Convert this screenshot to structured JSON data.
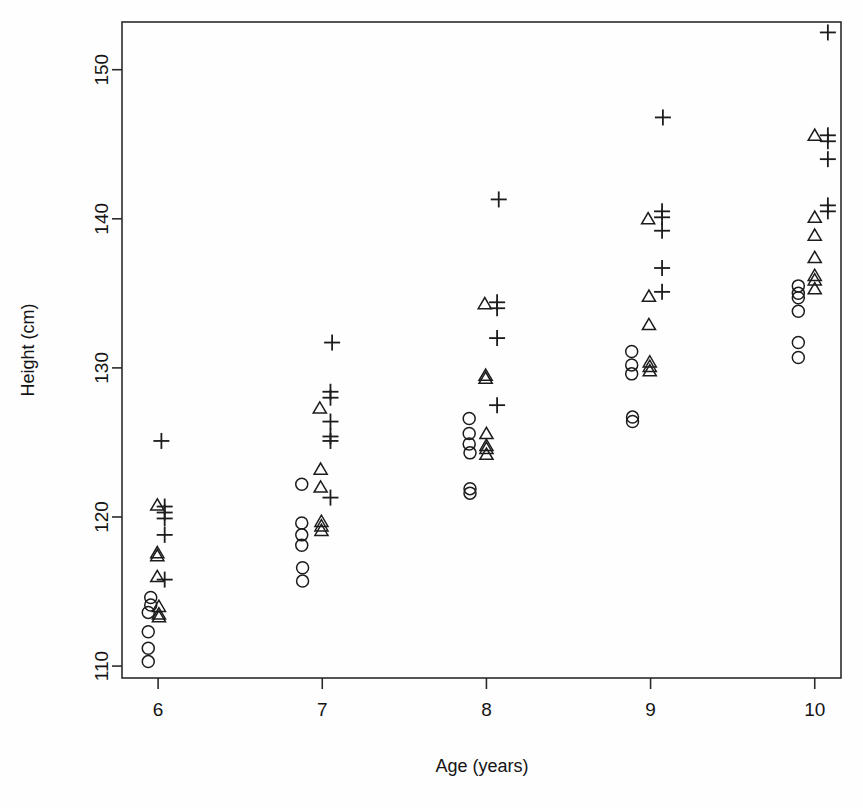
{
  "chart_data": {
    "type": "scatter",
    "title": "",
    "xlabel": "Age (years)",
    "ylabel": "Height (cm)",
    "xlim": [
      5.78,
      10.16
    ],
    "ylim": [
      109.2,
      153.2
    ],
    "xticks": [
      6,
      7,
      8,
      9,
      10
    ],
    "yticks": [
      110,
      120,
      130,
      140,
      150
    ],
    "xtick_labels": [
      "6",
      "7",
      "8",
      "9",
      "10"
    ],
    "ytick_labels": [
      "110",
      "120",
      "130",
      "140",
      "150"
    ],
    "grid": false,
    "legend": "none",
    "marker_color": "#1c1c1c",
    "background": "#ffffff",
    "series": [
      {
        "name": "circle",
        "marker": "open-circle",
        "points": [
          [
            5.955,
            114.6
          ],
          [
            5.955,
            114.1
          ],
          [
            5.94,
            113.6
          ],
          [
            5.94,
            112.3
          ],
          [
            5.94,
            111.2
          ],
          [
            5.94,
            110.3
          ],
          [
            6.875,
            122.2
          ],
          [
            6.875,
            119.6
          ],
          [
            6.875,
            118.8
          ],
          [
            6.875,
            118.1
          ],
          [
            6.88,
            116.6
          ],
          [
            6.88,
            115.7
          ],
          [
            7.895,
            126.6
          ],
          [
            7.895,
            125.6
          ],
          [
            7.895,
            124.9
          ],
          [
            7.9,
            124.3
          ],
          [
            7.9,
            121.9
          ],
          [
            7.9,
            121.6
          ],
          [
            8.885,
            131.1
          ],
          [
            8.885,
            130.2
          ],
          [
            8.885,
            129.6
          ],
          [
            8.89,
            126.7
          ],
          [
            8.89,
            126.4
          ],
          [
            9.9,
            135.5
          ],
          [
            9.9,
            135.0
          ],
          [
            9.9,
            134.7
          ],
          [
            9.9,
            133.8
          ],
          [
            9.9,
            131.7
          ],
          [
            9.9,
            130.7
          ]
        ]
      },
      {
        "name": "triangle",
        "marker": "open-triangle",
        "points": [
          [
            5.995,
            120.8
          ],
          [
            5.995,
            117.6
          ],
          [
            5.995,
            117.4
          ],
          [
            5.995,
            116.0
          ],
          [
            6.005,
            114.0
          ],
          [
            6.005,
            113.5
          ],
          [
            6.005,
            113.3
          ],
          [
            6.985,
            127.3
          ],
          [
            6.99,
            123.2
          ],
          [
            6.99,
            122.0
          ],
          [
            6.995,
            119.7
          ],
          [
            6.995,
            119.4
          ],
          [
            6.995,
            119.1
          ],
          [
            7.99,
            134.3
          ],
          [
            7.995,
            129.5
          ],
          [
            7.995,
            129.3
          ],
          [
            8.0,
            125.6
          ],
          [
            8.0,
            124.8
          ],
          [
            8.0,
            124.6
          ],
          [
            8.0,
            124.2
          ],
          [
            8.985,
            140.0
          ],
          [
            8.99,
            134.8
          ],
          [
            8.99,
            132.9
          ],
          [
            8.995,
            130.4
          ],
          [
            8.995,
            130.1
          ],
          [
            8.995,
            129.8
          ],
          [
            10.0,
            145.6
          ],
          [
            10.0,
            140.1
          ],
          [
            10.0,
            138.9
          ],
          [
            10.0,
            137.4
          ],
          [
            10.0,
            136.2
          ],
          [
            10.0,
            135.9
          ],
          [
            10.0,
            135.3
          ]
        ]
      },
      {
        "name": "plus",
        "marker": "plus",
        "points": [
          [
            6.02,
            125.1
          ],
          [
            6.04,
            120.7
          ],
          [
            6.04,
            120.3
          ],
          [
            6.04,
            119.9
          ],
          [
            6.04,
            118.8
          ],
          [
            6.04,
            115.8
          ],
          [
            7.06,
            131.7
          ],
          [
            7.05,
            128.4
          ],
          [
            7.05,
            128.0
          ],
          [
            7.05,
            126.4
          ],
          [
            7.05,
            125.4
          ],
          [
            7.05,
            125.1
          ],
          [
            7.05,
            121.3
          ],
          [
            8.075,
            141.3
          ],
          [
            8.065,
            134.4
          ],
          [
            8.065,
            134.0
          ],
          [
            8.065,
            132.0
          ],
          [
            8.065,
            127.5
          ],
          [
            9.075,
            146.8
          ],
          [
            9.07,
            140.5
          ],
          [
            9.07,
            140.1
          ],
          [
            9.07,
            139.2
          ],
          [
            9.07,
            136.7
          ],
          [
            9.07,
            135.1
          ],
          [
            10.08,
            152.5
          ],
          [
            10.08,
            145.6
          ],
          [
            10.08,
            145.2
          ],
          [
            10.08,
            144.0
          ],
          [
            10.08,
            140.9
          ],
          [
            10.08,
            140.5
          ]
        ]
      }
    ]
  },
  "plot_geometry": {
    "left": 122,
    "right": 841,
    "top": 22,
    "bottom": 678
  }
}
